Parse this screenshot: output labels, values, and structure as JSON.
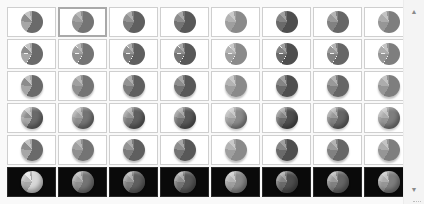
{
  "gallery": {
    "name": "Chart Styles",
    "columns": 8,
    "rows": 6,
    "selected_index": 1,
    "row_styles": [
      {
        "row": 1,
        "variant": "flat",
        "background": "#ffffff"
      },
      {
        "row": 2,
        "variant": "flat-outlined-slices",
        "background": "#ffffff"
      },
      {
        "row": 3,
        "variant": "flat-shadow",
        "background": "#ffffff"
      },
      {
        "row": 4,
        "variant": "bevel",
        "background": "#ffffff"
      },
      {
        "row": 5,
        "variant": "soft-shadow",
        "background": "#ffffff"
      },
      {
        "row": 6,
        "variant": "bevel-dark",
        "background": "#0a0a0a"
      }
    ],
    "column_palettes": [
      {
        "col": 1,
        "name": "Colorful",
        "colors": [
          "#6a6a6a",
          "#a6a6a6",
          "#8c8c8c",
          "#c4c4c4"
        ]
      },
      {
        "col": 2,
        "name": "Accent 1",
        "colors": [
          "#747474",
          "#8f8f8f",
          "#a0a0a0",
          "#b8b8b8"
        ]
      },
      {
        "col": 3,
        "name": "Accent 2",
        "colors": [
          "#5f5f5f",
          "#7c7c7c",
          "#939393",
          "#adadad"
        ]
      },
      {
        "col": 4,
        "name": "Accent 3",
        "colors": [
          "#585858",
          "#737373",
          "#8d8d8d",
          "#a8a8a8"
        ]
      },
      {
        "col": 5,
        "name": "Accent 4",
        "colors": [
          "#8a8a8a",
          "#9f9f9f",
          "#b3b3b3",
          "#c9c9c9"
        ]
      },
      {
        "col": 6,
        "name": "Accent 5",
        "colors": [
          "#4e4e4e",
          "#6a6a6a",
          "#848484",
          "#a0a0a0"
        ]
      },
      {
        "col": 7,
        "name": "Accent 6",
        "colors": [
          "#666666",
          "#818181",
          "#999999",
          "#b3b3b3"
        ]
      },
      {
        "col": 8,
        "name": "Accent 7",
        "colors": [
          "#7e7e7e",
          "#969696",
          "#acacac",
          "#c3c3c3"
        ]
      }
    ]
  },
  "scrollbar": {
    "up_arrow": "▲",
    "down_arrow": "▼"
  }
}
